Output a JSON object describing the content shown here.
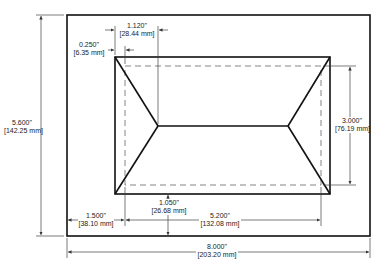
{
  "diagram": {
    "type": "mechanical-drawing",
    "colors": {
      "line": "#111111",
      "dim_line": "#444444",
      "dashed": "#666666",
      "text": "#222222",
      "background": "#ffffff"
    },
    "dimensions": {
      "overall_width": {
        "inch": "8.000\"",
        "mm": "[203.20 mm]"
      },
      "overall_height": {
        "inch": "5.600\"",
        "mm": "[142.25 mm]"
      },
      "left_offset": {
        "inch": "1.500\"",
        "mm": "[38.10 mm]"
      },
      "pocket_width": {
        "inch": "5.200\"",
        "mm": "[132.08 mm]"
      },
      "pocket_height": {
        "inch": "3.000\"",
        "mm": "[76.19 mm]"
      },
      "chamfer_width": {
        "inch": "1.120\"",
        "mm": "[28.44 mm]"
      },
      "wall_offset": {
        "inch": "0.250\"",
        "mm": "[6.35 mm]"
      },
      "bottom_offset": {
        "inch": "1.050\"",
        "mm": "[26.68 mm]"
      }
    }
  }
}
